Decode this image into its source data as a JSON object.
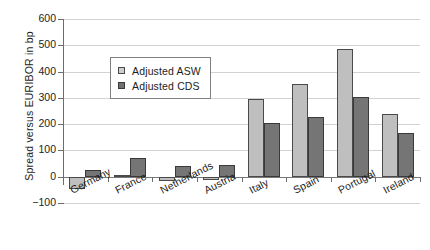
{
  "chart_data": {
    "type": "bar",
    "title": "",
    "xlabel": "",
    "ylabel": "Spread versus EURIBOR in bp",
    "ylim": [
      -100,
      600
    ],
    "ytick_step": 100,
    "yticks": [
      "600",
      "500",
      "400",
      "300",
      "200",
      "100",
      "0",
      "-100"
    ],
    "grid": true,
    "legend_position": "upper-left-inside",
    "categories": [
      "Germany",
      "France",
      "Netherlands",
      "Austria",
      "Italy",
      "Spain",
      "Portugal",
      "Ireland"
    ],
    "series": [
      {
        "name": "Adjusted ASW",
        "color": "#bfbfbf",
        "values": [
          -45,
          5,
          -17,
          -12,
          296,
          352,
          485,
          240
        ]
      },
      {
        "name": "Adjusted CDS",
        "color": "#757575",
        "values": [
          27,
          73,
          40,
          45,
          205,
          227,
          303,
          168
        ]
      }
    ]
  },
  "legend": {
    "items": [
      {
        "label": "Adjusted ASW",
        "swatch": "light-square-icon"
      },
      {
        "label": "Adjusted CDS",
        "swatch": "dark-square-icon"
      }
    ]
  }
}
